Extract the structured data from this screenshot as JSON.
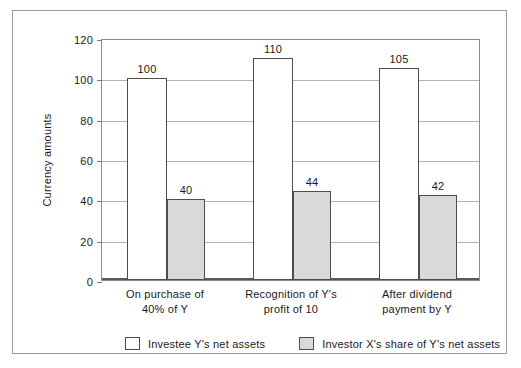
{
  "chart_data": {
    "type": "bar",
    "title": "",
    "subtitle": "",
    "xlabel": "",
    "ylabel": "Currency amounts",
    "ylim": [
      0,
      120
    ],
    "yticks": [
      0,
      20,
      40,
      60,
      80,
      100,
      120
    ],
    "ytick_labels": [
      "0",
      "20",
      "40",
      "60",
      "80",
      "100",
      "120"
    ],
    "grid": true,
    "grid_axis": "y",
    "legend_position": "bottom",
    "data_labels": true,
    "categories": [
      "On purchase of\n40% of Y",
      "Recognition of Y's\nprofit of 10",
      "After dividend\npayment by Y"
    ],
    "category_lines": [
      [
        "On purchase of",
        "40% of Y"
      ],
      [
        "Recognition of Y's",
        "profit of 10"
      ],
      [
        "After dividend",
        "payment by Y"
      ]
    ],
    "series": [
      {
        "name": "Investee Y's net assets",
        "key": "series-a",
        "color": "#ffffff",
        "edge_color": "#4d4d4d",
        "values": [
          100,
          110,
          105
        ],
        "value_labels": [
          "100",
          "110",
          "105"
        ]
      },
      {
        "name": "Investor X's share of Y's net assets",
        "key": "series-b",
        "color": "#d9d9d9",
        "edge_color": "#4d4d4d",
        "values": [
          40,
          44,
          42
        ],
        "value_labels": [
          "40",
          "44",
          "42"
        ]
      }
    ]
  },
  "figure": {
    "frame_color": "#9a9a9a",
    "axis_color": "#595959",
    "gridline_color": "#b3b3b3",
    "background": "#ffffff"
  }
}
